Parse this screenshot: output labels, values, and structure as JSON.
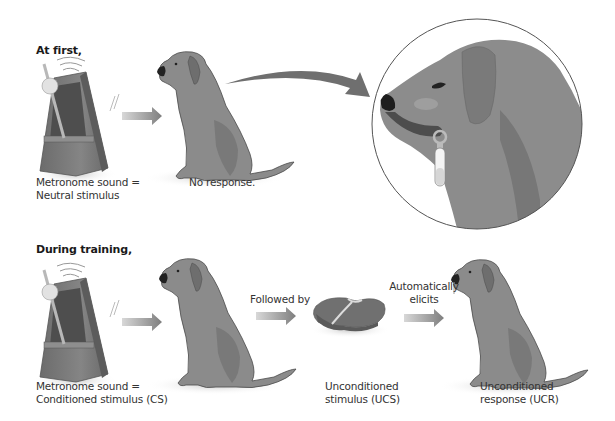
{
  "rows": [
    {
      "heading": "At first,",
      "metronome_label": [
        "Metronome sound =",
        "Neutral stimulus"
      ],
      "dog_label": "No response."
    },
    {
      "heading": "During training,",
      "metronome_label": [
        "Metronome sound =",
        "Conditioned stimulus (CS)"
      ],
      "arrow_label_1": "Followed by",
      "food_label": [
        "Unconditioned",
        "stimulus (UCS)"
      ],
      "arrow_label_2": [
        "Automatically",
        "elicits"
      ],
      "dog_label": [
        "Unconditioned",
        "response (UCR)"
      ]
    }
  ],
  "icons": {
    "metronome": "metronome-icon",
    "dog": "dog-icon",
    "food": "meat-icon",
    "arrow": "arrow-right-icon",
    "curved_arrow": "curved-arrow-icon",
    "zoom_inset": "dog-head-saliva-tube-icon"
  },
  "colors": {
    "background": "#ffffff",
    "dog_fill": "#8a8a8a",
    "dog_dark": "#5e5e5e",
    "metronome_fill": "#7a7a7a",
    "arrow_fill": "#8c8c8c",
    "curved_arrow_fill": "#6f6f6f",
    "circle_stroke": "#555555"
  }
}
